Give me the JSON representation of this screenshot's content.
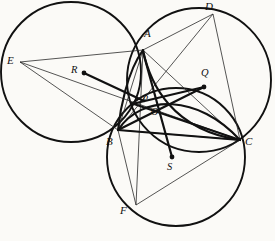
{
  "figure": {
    "type": "geometry-diagram",
    "width": 275,
    "height": 241,
    "background_color": "#fbfaf7",
    "ink_color": "#111111"
  },
  "points": [
    {
      "id": "A",
      "label": "A",
      "x": 143,
      "y": 50,
      "label_x": 144,
      "label_y": 28,
      "kind": "vertex",
      "dot": false
    },
    {
      "id": "B",
      "label": "B",
      "x": 118,
      "y": 130,
      "label_x": 106,
      "label_y": 136,
      "kind": "vertex",
      "dot": false
    },
    {
      "id": "C",
      "label": "C",
      "x": 240,
      "y": 140,
      "label_x": 245,
      "label_y": 136,
      "kind": "vertex",
      "dot": false
    },
    {
      "id": "D",
      "label": "D",
      "x": 213,
      "y": 14,
      "label_x": 205,
      "label_y": 1,
      "kind": "vertex",
      "dot": false
    },
    {
      "id": "E",
      "label": "E",
      "x": 20,
      "y": 62,
      "label_x": 7,
      "label_y": 55,
      "kind": "vertex",
      "dot": false
    },
    {
      "id": "F",
      "label": "F",
      "x": 136,
      "y": 205,
      "label_x": 120,
      "label_y": 205,
      "kind": "vertex",
      "dot": false
    },
    {
      "id": "P",
      "label": "P",
      "x": 143,
      "y": 100,
      "label_x": 142,
      "label_y": 94,
      "kind": "intersection",
      "dot": false
    },
    {
      "id": "O",
      "label": "O",
      "x": 152,
      "y": 112,
      "label_x": 151,
      "label_y": 107,
      "kind": "intersection",
      "dot": false
    },
    {
      "id": "R",
      "label": "R",
      "x": 84,
      "y": 73,
      "label_x": 71,
      "label_y": 65,
      "kind": "center",
      "dot": true
    },
    {
      "id": "Q",
      "label": "Q",
      "x": 204,
      "y": 87,
      "label_x": 201,
      "label_y": 68,
      "kind": "center",
      "dot": true
    },
    {
      "id": "S",
      "label": "S",
      "x": 172,
      "y": 157,
      "label_x": 167,
      "label_y": 162,
      "kind": "center",
      "dot": true
    }
  ],
  "circles": [
    {
      "id": "circle-R",
      "center_id": "R",
      "cx": 71,
      "cy": 72,
      "r": 70,
      "stroke_width": 1.9
    },
    {
      "id": "circle-Q",
      "center_id": "Q",
      "cx": 199,
      "cy": 80,
      "r": 72,
      "stroke_width": 1.9
    },
    {
      "id": "circle-S",
      "center_id": "S",
      "cx": 176,
      "cy": 157,
      "r": 69,
      "stroke_width": 1.9
    }
  ],
  "thin_segments": [
    {
      "id": "E-A",
      "from": "E",
      "to": "A"
    },
    {
      "id": "E-C",
      "from": "E",
      "to": "C"
    },
    {
      "id": "A-D",
      "from": "A",
      "to": "D"
    },
    {
      "id": "D-C",
      "from": "D",
      "to": "C"
    },
    {
      "id": "B-D",
      "from": "B",
      "to": "D"
    },
    {
      "id": "A-F",
      "from": "A",
      "to": "F"
    },
    {
      "id": "B-C",
      "from": "B",
      "to": "C"
    },
    {
      "id": "B-F",
      "from": "B",
      "to": "F"
    },
    {
      "id": "F-C",
      "from": "F",
      "to": "C"
    },
    {
      "id": "A-B",
      "from": "A",
      "to": "B"
    },
    {
      "id": "A-C",
      "from": "A",
      "to": "C"
    },
    {
      "id": "E-B",
      "from": "E",
      "to": "B"
    }
  ],
  "thick_segments": [
    {
      "id": "R-P",
      "from": "R",
      "to": "P"
    },
    {
      "id": "Q-P",
      "from": "Q",
      "to": "P"
    },
    {
      "id": "S-P",
      "from": "S",
      "to": "P"
    },
    {
      "id": "B-Q",
      "from": "B",
      "to": "Q"
    },
    {
      "id": "B-O",
      "from": "B",
      "to": "O"
    },
    {
      "id": "O-C",
      "from": "O",
      "to": "C"
    },
    {
      "id": "P-C",
      "from": "P",
      "to": "C"
    }
  ],
  "arcs": [
    {
      "id": "arc-A-P-B",
      "d": "M 143 50 C 128 70 122 112 118 130",
      "note": "thick arc of circle R through A and B"
    },
    {
      "id": "arc-A-O-C",
      "d": "M 143 50 C 152 82 168 132 240 140",
      "note": "thick arc of circle Q through A and C"
    },
    {
      "id": "arc-B-P-C",
      "d": "M 118 130 C 140 96 196 96 240 140",
      "note": "thick arc of circle S through B and C"
    }
  ]
}
